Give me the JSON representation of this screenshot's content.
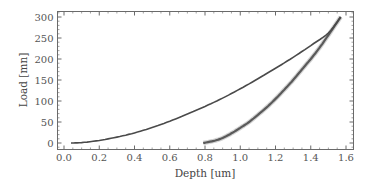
{
  "chart_data": {
    "type": "line",
    "title": "",
    "xlabel": "Depth [um]",
    "ylabel": "Load [mn]",
    "xlim": [
      -0.04,
      1.65
    ],
    "ylim": [
      -15,
      315
    ],
    "x_ticks": [
      0.0,
      0.2,
      0.4,
      0.6,
      0.8,
      1.0,
      1.2,
      1.4,
      1.6
    ],
    "x_tick_labels": [
      "0.0",
      "0.2",
      "0.4",
      "0.6",
      "0.8",
      "1.0",
      "1.2",
      "1.4",
      "1.6"
    ],
    "y_ticks": [
      0,
      50,
      100,
      150,
      200,
      250,
      300
    ],
    "y_tick_labels": [
      "0",
      "50",
      "100",
      "150",
      "200",
      "250",
      "300"
    ],
    "grid": false,
    "legend": null,
    "series": [
      {
        "name": "Loading",
        "x": [
          0.04,
          0.1,
          0.2,
          0.3,
          0.4,
          0.5,
          0.6,
          0.7,
          0.8,
          0.9,
          1.0,
          1.1,
          1.2,
          1.3,
          1.4,
          1.5,
          1.57
        ],
        "y": [
          0,
          1,
          6,
          14,
          24,
          37,
          52,
          69,
          87,
          107,
          129,
          153,
          178,
          204,
          232,
          262,
          300
        ]
      },
      {
        "name": "Unloading",
        "x": [
          0.79,
          0.85,
          0.9,
          0.95,
          1.0,
          1.05,
          1.1,
          1.15,
          1.2,
          1.25,
          1.3,
          1.35,
          1.4,
          1.45,
          1.5,
          1.57
        ],
        "y": [
          0,
          5,
          12,
          23,
          36,
          50,
          67,
          85,
          105,
          127,
          150,
          175,
          200,
          227,
          257,
          300
        ]
      }
    ]
  }
}
